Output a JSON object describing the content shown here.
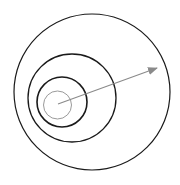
{
  "diagram": {
    "canvas": {
      "width": 180,
      "height": 185,
      "background": "#ffffff"
    },
    "circles": [
      {
        "name": "outer-circle",
        "cx": 92,
        "cy": 92,
        "r": 78,
        "stroke": "#1a1a1a",
        "stroke_width": 1.2
      },
      {
        "name": "second-circle",
        "cx": 72,
        "cy": 98,
        "r": 44,
        "stroke": "#1a1a1a",
        "stroke_width": 1.3
      },
      {
        "name": "third-circle",
        "cx": 62,
        "cy": 102,
        "r": 25,
        "stroke": "#1a1a1a",
        "stroke_width": 1.6
      },
      {
        "name": "inner-circle",
        "cx": 57.5,
        "cy": 105,
        "r": 14,
        "stroke": "#9a9a9a",
        "stroke_width": 1
      }
    ],
    "arrow": {
      "x1": 58,
      "y1": 104,
      "x2": 157,
      "y2": 68,
      "color": "#8a8a8a",
      "stroke_width": 1.2
    }
  }
}
